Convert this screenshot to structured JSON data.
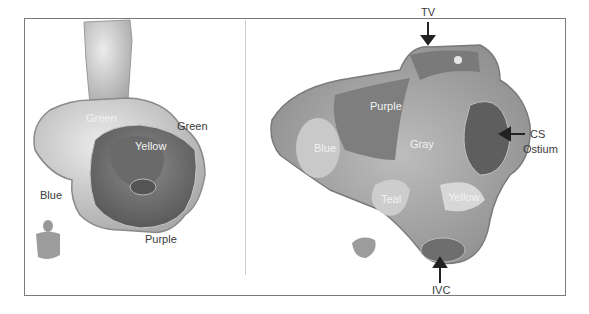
{
  "figure": {
    "left_panel": {
      "labels": {
        "green_top": "Green",
        "green_right": "Green",
        "yellow": "Yellow",
        "blue": "Blue",
        "purple": "Purple"
      }
    },
    "right_panel": {
      "labels": {
        "tv": "TV",
        "purple": "Purple",
        "blue": "Blue",
        "gray": "Gray",
        "cs": "CS",
        "ostium": "Ostium",
        "teal": "Teal",
        "yellow": "Yellow",
        "ivc": "IVC"
      }
    },
    "colors": {
      "frame": "#7a7a7a",
      "light_surface": "#d9d9d9",
      "mid_surface": "#a8a8a8",
      "dark_surface": "#6e6e6e"
    }
  }
}
